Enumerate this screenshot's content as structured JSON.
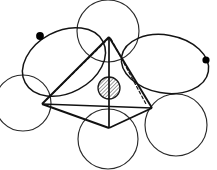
{
  "figure": {
    "kind": "hand-drawn-orbital-diagram",
    "title": "",
    "caption": "",
    "canvas": {
      "width": 217,
      "height": 170,
      "background": "#ffffff"
    },
    "colors": {
      "ink": "#1a1a1a",
      "ink_light": "#3a3a3a",
      "hatch": "#1a1a1a",
      "marker_fill": "#000000",
      "paper": "#ffffff"
    },
    "stroke_widths": {
      "lobe": 1.15,
      "frame_solid": 1.9,
      "frame_dashed": 1.25,
      "hatch": 0.85,
      "core_outline": 1.3
    },
    "lobes": [
      {
        "name": "lobe-upper-left",
        "shape": "ellipse",
        "cx": 64,
        "cy": 62,
        "rx": 44,
        "ry": 31,
        "rotation": -28,
        "marker": {
          "name": "marker-upper-left",
          "cx": 40,
          "cy": 36,
          "r": 3.9
        }
      },
      {
        "name": "lobe-right",
        "shape": "ellipse",
        "cx": 165,
        "cy": 64,
        "rx": 44,
        "ry": 29,
        "rotation": 10,
        "marker": {
          "name": "marker-right",
          "cx": 206,
          "cy": 60,
          "r": 3.6
        }
      },
      {
        "name": "lobe-top",
        "shape": "circle",
        "cx": 108,
        "cy": 31,
        "rx": 31,
        "ry": 31,
        "rotation": 0,
        "marker": null
      },
      {
        "name": "lobe-left",
        "shape": "circle",
        "cx": 23,
        "cy": 103,
        "rx": 28,
        "ry": 28,
        "rotation": 0,
        "marker": null
      },
      {
        "name": "lobe-bottom",
        "shape": "circle",
        "cx": 108,
        "cy": 139,
        "rx": 30,
        "ry": 30,
        "rotation": 0,
        "marker": null
      },
      {
        "name": "lobe-bottom-right",
        "shape": "circle",
        "cx": 176,
        "cy": 125,
        "rx": 31,
        "ry": 31,
        "rotation": 0,
        "marker": null
      }
    ],
    "core": {
      "name": "central-hatched-sphere",
      "cx": 109,
      "cy": 88,
      "r": 11,
      "hatch_angle_deg": 45,
      "hatch_spacing": 2.6
    },
    "frame": {
      "name": "tetrahedral-wireframe",
      "vertices": {
        "apex": {
          "name": "vertex-apex",
          "x": 109,
          "y": 37
        },
        "left": {
          "name": "vertex-left",
          "x": 42,
          "y": 104
        },
        "right": {
          "name": "vertex-right",
          "x": 152,
          "y": 108
        },
        "front": {
          "name": "vertex-front",
          "x": 109,
          "y": 128
        },
        "back_hidden": {
          "name": "vertex-back-hidden",
          "x": 126,
          "y": 96
        }
      },
      "solid_edges": [
        {
          "name": "edge-apex-left",
          "from": "apex",
          "to": "left"
        },
        {
          "name": "edge-apex-right",
          "from": "apex",
          "to": "right"
        },
        {
          "name": "edge-apex-front",
          "from": "apex",
          "to": "front"
        },
        {
          "name": "edge-left-front",
          "from": "left",
          "to": "front"
        },
        {
          "name": "edge-right-front",
          "from": "right",
          "to": "front"
        },
        {
          "name": "edge-left-right",
          "from": "left",
          "to": "right"
        }
      ],
      "dashed_edges": [
        {
          "name": "edge-hidden-apex-backleft",
          "from": "apex",
          "to": "left-upper"
        },
        {
          "name": "edge-hidden-apex-backright",
          "from": "apex",
          "to": "right-upper"
        }
      ],
      "dash_pattern": "3,2.4"
    },
    "markers": {
      "count": 2,
      "description": "filled circular node markers"
    }
  }
}
